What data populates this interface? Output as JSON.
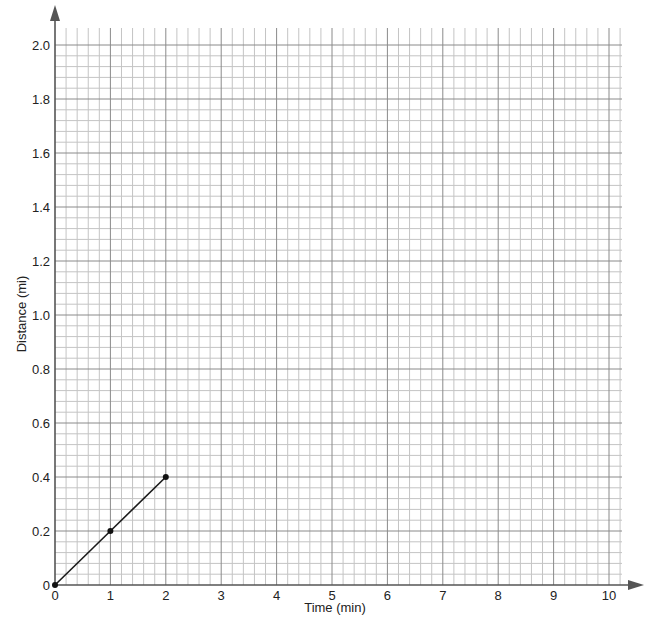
{
  "chart_data": {
    "type": "line",
    "title": "",
    "xlabel": "Time (min)",
    "ylabel": "Distance (mi)",
    "xlim": [
      0,
      10
    ],
    "ylim": [
      0,
      2.0
    ],
    "x_ticks": [
      "0",
      "1",
      "2",
      "3",
      "4",
      "5",
      "6",
      "7",
      "8",
      "9",
      "10"
    ],
    "y_ticks": [
      "0",
      "0.2",
      "0.4",
      "0.6",
      "0.8",
      "1.0",
      "1.2",
      "1.4",
      "1.6",
      "1.8",
      "2.0"
    ],
    "grid": true,
    "grid_minor_x_step": 0.2,
    "grid_minor_y_step": 0.04,
    "legend": null,
    "series": [
      {
        "name": "distance",
        "x": [
          0,
          1,
          2
        ],
        "y": [
          0,
          0.2,
          0.4
        ],
        "color": "#1a1a1a",
        "markers": true
      }
    ]
  },
  "layout": {
    "origin_px": [
      55,
      585
    ],
    "px_per_x_unit": 55.4,
    "px_per_y_unit": 270,
    "grid_right_px": 622,
    "grid_top_px": 28,
    "x_axis_end_px": 644,
    "y_axis_top_px": 5
  }
}
